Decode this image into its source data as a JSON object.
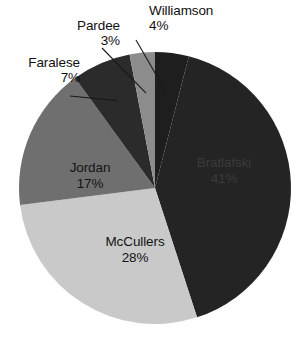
{
  "chart_data": {
    "type": "pie",
    "title": "",
    "subtitle": "",
    "xlabel": "",
    "ylabel": "",
    "legend_position": "none",
    "grid": false,
    "value_unit": "%",
    "total": 100,
    "start_angle_deg": 0,
    "direction": "clockwise",
    "categories": [
      "Williamson",
      "Bratlafski",
      "McCullers",
      "Jordan",
      "Faralese",
      "Pardee"
    ],
    "values": [
      4,
      41,
      28,
      17,
      7,
      3
    ],
    "slices": [
      {
        "name": "Williamson",
        "value": 4,
        "label": "Williamson",
        "pct_label": "4%",
        "color": "#1e1e1e",
        "label_placement": "outside",
        "has_leader_line": true
      },
      {
        "name": "Bratlafski",
        "value": 41,
        "label": "Bratlafski",
        "pct_label": "41%",
        "color": "#242424",
        "label_placement": "inside",
        "has_leader_line": false
      },
      {
        "name": "McCullers",
        "value": 28,
        "label": "McCullers",
        "pct_label": "28%",
        "color": "#c9c9c9",
        "label_placement": "inside",
        "has_leader_line": false
      },
      {
        "name": "Jordan",
        "value": 17,
        "label": "Jordan",
        "pct_label": "17%",
        "color": "#6f6f6f",
        "label_placement": "inside",
        "has_leader_line": false
      },
      {
        "name": "Faralese",
        "value": 7,
        "label": "Faralese",
        "pct_label": "7%",
        "color": "#2b2b2b",
        "label_placement": "outside",
        "has_leader_line": true
      },
      {
        "name": "Pardee",
        "value": 3,
        "label": "Pardee",
        "pct_label": "3%",
        "color": "#8c8c8c",
        "label_placement": "outside",
        "has_leader_line": true
      }
    ],
    "geometry": {
      "center_x": 155,
      "center_y": 188,
      "radius": 136
    }
  }
}
